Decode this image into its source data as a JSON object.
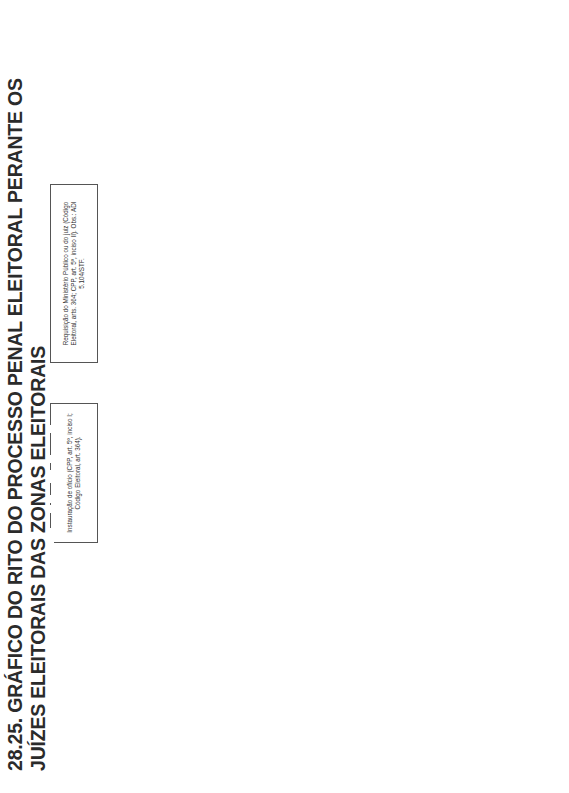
{
  "title": "28.25. GRÁFICO DO RITO DO PROCESSO PENAL ELEITORAL PERANTE OS JUÍZES ELEITORAIS DAS ZONAS ELEITORAIS",
  "boxes": {
    "requisicao": "Requisição do Ministério Público ou do juiz (Código Eleitoral, arts. 364; CPP, art. 5º, inciso II). Obs.: ADI 5.104/STF.",
    "instauracao": "Instauração de ofício (CPP, art. 5º, inciso I; Código Eleitoral, art. 364).",
    "auto_prisao": "Auto de prisão em flagrante (CPP, arts. 301 e 306; Código Eleitoral, art. 364).",
    "noticia_crime": "Notícia de crime (Código Eleitoral, art. 356).",
    "lavratura": "Lavratura do Termo Circunstanciado em se tratando de crime de menor potencial ofensivo (Lei 9.099/1995, arts. 61 e 69) ou instauração de inquérito policial eleitoral quando não for delito de menor potencial ofensivo (CPP, arts. 4º e seguintes; Código Eleitoral, art. 364). Atribuição da polícia federal e, subsidiariamente, da polícia civil.",
    "termo_encaminhado": "O Termo Circunstanciado ou inquérito policial eleitoral é encaminhado ao juiz da zona eleitoral do local do crime (CPP, art. 70).",
    "requisitar_diligencias": "Requisitar diligências (CPP, art. 16; Código Eleitoral, art. 364).",
    "oferecimento_transacao": "Oferecimento da transação penal nos crimes de menor potencial ofensivo (art. 76, 2ª parte, Lei 9.099/1995).",
    "rejeicao_transacao": "Rejeição da transação penal pelo autor do fato.",
    "aceitacao_transacao": "Aceitação da transação penal pelo autor do fato. Cumprimento da transação penal. Extinção da punibilidade.",
    "promotor_arquivamento": "O promotor eleitoral se manifesta pelo arquivamento.",
    "juiz_encaminha_mp": "O juiz eleitoral encaminha ao Ministério Público (promotor eleitoral da Zona Eleitoral).",
    "juiz_defere": "Juiz eleitoral defere. Arquivado.",
    "juiz_indefere": "Juiz eleitoral indefere (Código Eleitoral, art. 357, § 1º).",
    "oferecimento_denuncia": "Oferecimento da denúncia. Ao oferecer a denúncia, o Ministério Público deve verificar se cabe a suspensão condicional do processo. Cumpre ao promotor eleitoral, ao oferecer a denúncia, propor o sursis processual se preenchidos os requisitos do art. 89 da Lei 9.099/1995. Prazo para a denúncia: 10 dias (art. 357 do Código Eleitoral). O número de testemunhas que a denúncia pode arrolar é, no máximo, de 8.",
    "autos_procurador": "Os autos são encaminhados ao procurador regional eleitoral. Aplica-se o art. 62, IV, da Lei Complementar 65/1993 e o Enunciado nº 29 do Conselho Superior do Ministério Público Federal – 2ª Câmara de Revisão, ou seja, caberá ao Conselho Superior examinar o arquivamento.",
    "designacao_promotor": "Designação do promotor eleitoral pelo procurador regional eleitoral, com indicação do procurador-geral de Justiça, para oferecer a denúncia ou prosseguir nas investigações. Ato complexo. Art. 1º, inciso I, da Resolução nº 30 do Conselho Nacional do Ministério Público, de 19 de maio de 2008.",
    "juiz_rejeita": "O juiz eleitoral rejeita a denúncia (CPP, art. 395; Código Eleitoral, art. 364). Caberá recurso em sentido estrito ao Tribunal Regional Eleitoral (CPP, art. 581; Código Eleitoral, art. 364).",
    "juiz_recebe": "O juiz eleitoral recebe a denúncia (Código Eleitoral, art. 359) e notifica a defesa para apresentar a resposta preliminar.",
    "defesa_resposta": "A defesa, em 10 dias, deverá apresentar a resposta preliminar (CPP, arts. 396 e 396-A).",
    "absolvicao_sumaria": "Absolvição sumária (CPP, art. 397). Cabe da decisão o recurso de apelação criminal eleitoral (Código Eleitoral, art. 362) ao TRE, no prazo de 10 dias. Contrarrazões em 10 dias.",
    "juiz_nao_absolve_1": "O juiz eleitoral não absolve sumariamente o acusado. Designação de audiência de instrução, com base no art. 360 do Código Eleitoral, em que será realizada a oitiva das testemunhas de acusação e de defesa e, em seguida, o acusado será interrogado.",
    "juiz_nao_absolve_2": "O interrogatório do acusado deve ser o último ato da audiência, conforme previsto no art. 13 da Resolução do TSE nº 23.396/2013, que determina a aplicação subsidiária do artigo 400 do Código de Processo Penal.",
    "juiz_nao_absolve_3": "Na ata de audiência são determinadas as diligências complementares requeridas pelas partes e ex officio pelo juiz.",
    "alegacoes_finais": "Alegações finais do Ministério Público e da defesa em 5 dias, sucessivamente (Código Eleitoral, art. 360).",
    "sentenca": "Sentença no prazo de 48 horas (Código Eleitoral, art. 361). Cabe recurso de apelação no prazo de 10 dias (Código Eleitoral, art. 362). Contrarrazões no mesmo prazo. Encaminhamento ao TRE para julgamento."
  }
}
